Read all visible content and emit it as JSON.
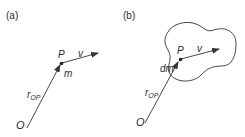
{
  "panels": [
    {
      "id": "a",
      "label": "(a)",
      "point_label": "P",
      "velocity_label": "v",
      "mass_label": "m",
      "position_label_main": "r",
      "position_label_sub": "OP",
      "origin_label": "O"
    },
    {
      "id": "b",
      "label": "(b)",
      "point_label": "P",
      "velocity_label": "v",
      "mass_label": "dm",
      "position_label_main": "r",
      "position_label_sub": "OP",
      "origin_label": "O"
    }
  ],
  "colors": {
    "stroke": "#333333",
    "text": "#2a2a2a",
    "background": "#ffffff"
  }
}
